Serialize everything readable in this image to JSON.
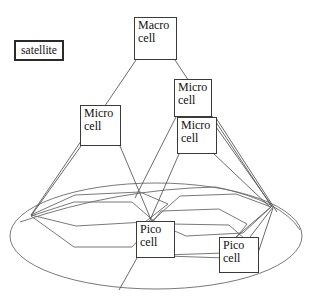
{
  "diagram": {
    "type": "layered-cell-hierarchy-diagram",
    "canvas": {
      "width": 316,
      "height": 301,
      "background": "#ffffff"
    },
    "colors": {
      "stroke": "#5a5a5a",
      "hex_stroke": "#6a6a6a",
      "box_border": "#3a3a3a",
      "satellite_border": "#2a2a2a",
      "text": "#111111",
      "background": "#ffffff"
    },
    "nodes": [
      {
        "id": "satellite",
        "label": "satellite",
        "lines": [
          "satellite"
        ],
        "x": 14,
        "y": 40,
        "w": 50,
        "h": 21,
        "font_size": 11.5,
        "align": "center"
      },
      {
        "id": "macro-cell",
        "label": "Macro cell",
        "lines": [
          "Macro",
          "cell"
        ],
        "x": 134,
        "y": 17,
        "w": 43,
        "h": 43,
        "font_size": 12,
        "align": "left"
      },
      {
        "id": "micro-cell-left",
        "label": "Micro cell",
        "lines": [
          "Micro",
          "cell"
        ],
        "x": 80,
        "y": 105,
        "w": 41,
        "h": 41,
        "font_size": 12,
        "align": "left"
      },
      {
        "id": "micro-cell-right-upper",
        "label": "Micro cell",
        "lines": [
          "Micro",
          "cell"
        ],
        "x": 174,
        "y": 79,
        "w": 38,
        "h": 38,
        "font_size": 12,
        "align": "left"
      },
      {
        "id": "micro-cell-right-lower",
        "label": "Micro cell",
        "lines": [
          "Micro",
          "cell"
        ],
        "x": 177,
        "y": 117,
        "w": 40,
        "h": 37,
        "font_size": 12,
        "align": "left"
      },
      {
        "id": "pico-cell-left",
        "label": "Pico cell",
        "lines": [
          "Pico",
          "cell"
        ],
        "x": 136,
        "y": 221,
        "w": 39,
        "h": 37,
        "font_size": 12,
        "align": "left"
      },
      {
        "id": "pico-cell-right",
        "label": "Pico cell",
        "lines": [
          "Pico",
          "cell"
        ],
        "x": 219,
        "y": 237,
        "w": 40,
        "h": 36,
        "font_size": 12,
        "align": "left"
      }
    ],
    "base_ellipse": {
      "cx": 156,
      "cy": 236,
      "rx": 146,
      "ry": 53
    },
    "cone_edges": [
      {
        "name": "macro-to-base-left",
        "d": "M 136 60 L 31 215"
      },
      {
        "name": "macro-to-base-right",
        "d": "M 175 60 L 272 207"
      },
      {
        "name": "micro-left-to-base-left",
        "d": "M 81 146 L 31 216"
      },
      {
        "name": "micro-left-to-pico-left",
        "d": "M 120 146 L 152 222"
      },
      {
        "name": "micro-right-upper-to-left",
        "d": "M 176 117 L 135 198"
      },
      {
        "name": "micro-right-upper-to-right",
        "d": "M 209 117 L 272 206"
      },
      {
        "name": "micro-right-lower-to-left",
        "d": "M 179 154 L 140 243"
      },
      {
        "name": "micro-right-lower-to-right",
        "d": "M 214 154 L 271 208"
      },
      {
        "name": "pico-left-side-left",
        "d": "M 137 258 L 119 290"
      },
      {
        "name": "pico-right-flare-a",
        "d": "M 236 237 L 272 206"
      },
      {
        "name": "pico-right-flare-b",
        "d": "M 250 237 L 273 207"
      },
      {
        "name": "pico-right-flare-c",
        "d": "M 258 253 L 273 208"
      },
      {
        "name": "micro-right-lower-slant",
        "d": "M 216 118 L 277 212"
      }
    ],
    "hexagons": [
      {
        "name": "hex-left-lower",
        "points": "31,216 74,202 132,202 155,222 132,247 74,247"
      },
      {
        "name": "hex-left-upper",
        "points": "31,215 75,195 140,192 168,204 145,222 76,226"
      },
      {
        "name": "hex-center",
        "points": "137,243 161,211 219,209 247,224 224,253 165,255"
      },
      {
        "name": "hex-right",
        "points": "152,221 180,196 236,194 271,207 243,233 186,236"
      },
      {
        "name": "hex-bottom",
        "points": "140,245 166,256 226,258 253,246 229,225 171,224"
      }
    ],
    "legend_note": ""
  }
}
